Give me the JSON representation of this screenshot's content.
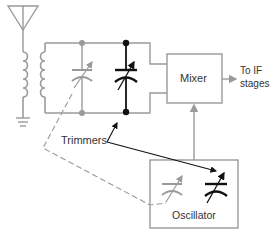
{
  "diagram": {
    "type": "superheterodyne-front-end-schematic",
    "colors": {
      "gray_wire": "#9a9a9a",
      "black_component": "#111111",
      "label_text": "#333333",
      "box_border": "#9a9a9a"
    },
    "blocks": {
      "mixer": {
        "label": "Mixer"
      },
      "oscillator": {
        "label": "Oscillator"
      }
    },
    "output": {
      "line1": "To IF",
      "line2": "stages"
    },
    "annotations": {
      "trimmers": "Trimmers"
    },
    "components": [
      {
        "id": "antenna",
        "kind": "antenna"
      },
      {
        "id": "rf-transformer",
        "kind": "transformer"
      },
      {
        "id": "ground",
        "kind": "ground"
      },
      {
        "id": "tuning-cap-rf",
        "kind": "variable-capacitor",
        "color": "gray"
      },
      {
        "id": "trimmer-cap-rf",
        "kind": "trimmer-capacitor",
        "color": "black"
      },
      {
        "id": "tuning-cap-osc",
        "kind": "variable-capacitor",
        "color": "gray"
      },
      {
        "id": "trimmer-cap-osc",
        "kind": "trimmer-capacitor",
        "color": "black"
      }
    ],
    "connections": [
      "antenna -> rf-transformer primary -> ground",
      "rf-transformer secondary -> tuned circuit -> mixer",
      "oscillator -> mixer",
      "mixer -> To IF stages",
      "tuning-cap-rf ganged (dashed) with tuning-cap-osc"
    ]
  }
}
